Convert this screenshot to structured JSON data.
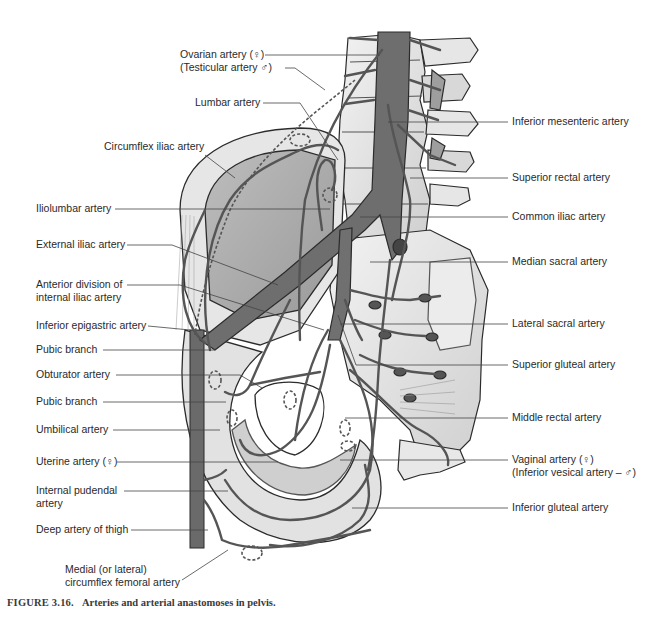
{
  "figure": {
    "caption_number": "FIGURE 3.16.",
    "caption_text": "Arteries and arterial anastomoses in pelvis.",
    "colors": {
      "artery": "#6e6e6e",
      "artery_dark": "#555555",
      "bone": "#e4e4e4",
      "bone_shade": "#c9c9c9",
      "outline": "#2b2b2b",
      "leader": "#444444"
    }
  },
  "labels_left": [
    {
      "id": "ovarian",
      "line1": "Ovarian artery (♀)",
      "line2": "(Testicular artery ♂)"
    },
    {
      "id": "lumbar",
      "line1": "Lumbar artery"
    },
    {
      "id": "circumflex-iliac",
      "line1": "Circumflex iliac artery"
    },
    {
      "id": "iliolumbar",
      "line1": "Iliolumbar artery"
    },
    {
      "id": "external-iliac",
      "line1": "External iliac artery"
    },
    {
      "id": "anterior-division",
      "line1": "Anterior division of",
      "line2": "internal iliac artery"
    },
    {
      "id": "inferior-epigastric",
      "line1": "Inferior epigastric artery"
    },
    {
      "id": "pubic-branch-1",
      "line1": "Pubic branch"
    },
    {
      "id": "obturator",
      "line1": "Obturator artery"
    },
    {
      "id": "pubic-branch-2",
      "line1": "Pubic branch"
    },
    {
      "id": "umbilical",
      "line1": "Umbilical artery"
    },
    {
      "id": "uterine",
      "line1": "Uterine artery (♀)"
    },
    {
      "id": "internal-pudendal",
      "line1": "Internal pudendal",
      "line2": "artery"
    },
    {
      "id": "deep-thigh",
      "line1": "Deep artery of thigh"
    },
    {
      "id": "circumflex-femoral",
      "line1": "Medial (or lateral)",
      "line2": "circumflex femoral artery"
    }
  ],
  "labels_right": [
    {
      "id": "inferior-mesenteric",
      "line1": "Inferior mesenteric artery"
    },
    {
      "id": "superior-rectal",
      "line1": "Superior rectal artery"
    },
    {
      "id": "common-iliac",
      "line1": "Common iliac artery"
    },
    {
      "id": "median-sacral",
      "line1": "Median sacral artery"
    },
    {
      "id": "lateral-sacral",
      "line1": "Lateral sacral artery"
    },
    {
      "id": "superior-gluteal",
      "line1": "Superior gluteal artery"
    },
    {
      "id": "middle-rectal",
      "line1": "Middle rectal artery"
    },
    {
      "id": "vaginal",
      "line1": "Vaginal artery (♀)",
      "line2": "(Inferior vesical artery – ♂)"
    },
    {
      "id": "inferior-gluteal",
      "line1": "Inferior gluteal artery"
    }
  ]
}
